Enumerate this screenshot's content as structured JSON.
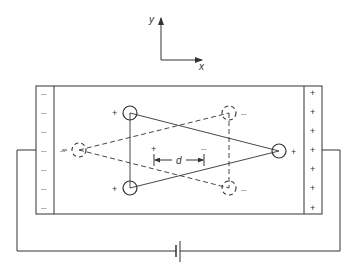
{
  "axes": {
    "x_label": "x",
    "y_label": "y"
  },
  "plates": {
    "left": {
      "sign": "--",
      "charges": [
        "--",
        "--",
        "--",
        "--",
        "--",
        "--",
        "--"
      ]
    },
    "right": {
      "sign": "+",
      "charges": [
        "+",
        "+",
        "+",
        "+",
        "+",
        "+",
        "+"
      ]
    }
  },
  "ions": {
    "positive": [
      {
        "label": "+",
        "position": "upper-left"
      },
      {
        "label": "+",
        "position": "lower-left"
      },
      {
        "label": "+",
        "position": "right"
      }
    ],
    "negative": [
      {
        "label": "--",
        "position": "left"
      },
      {
        "label": "--",
        "position": "upper-right"
      },
      {
        "label": "--",
        "position": "lower-right"
      }
    ]
  },
  "displacement": {
    "plus_label": "+",
    "minus_label": "--",
    "d_label": "d"
  },
  "circuit": {
    "battery": "battery-symbol"
  },
  "colors": {
    "stroke": "#333333",
    "background": "#ffffff"
  }
}
